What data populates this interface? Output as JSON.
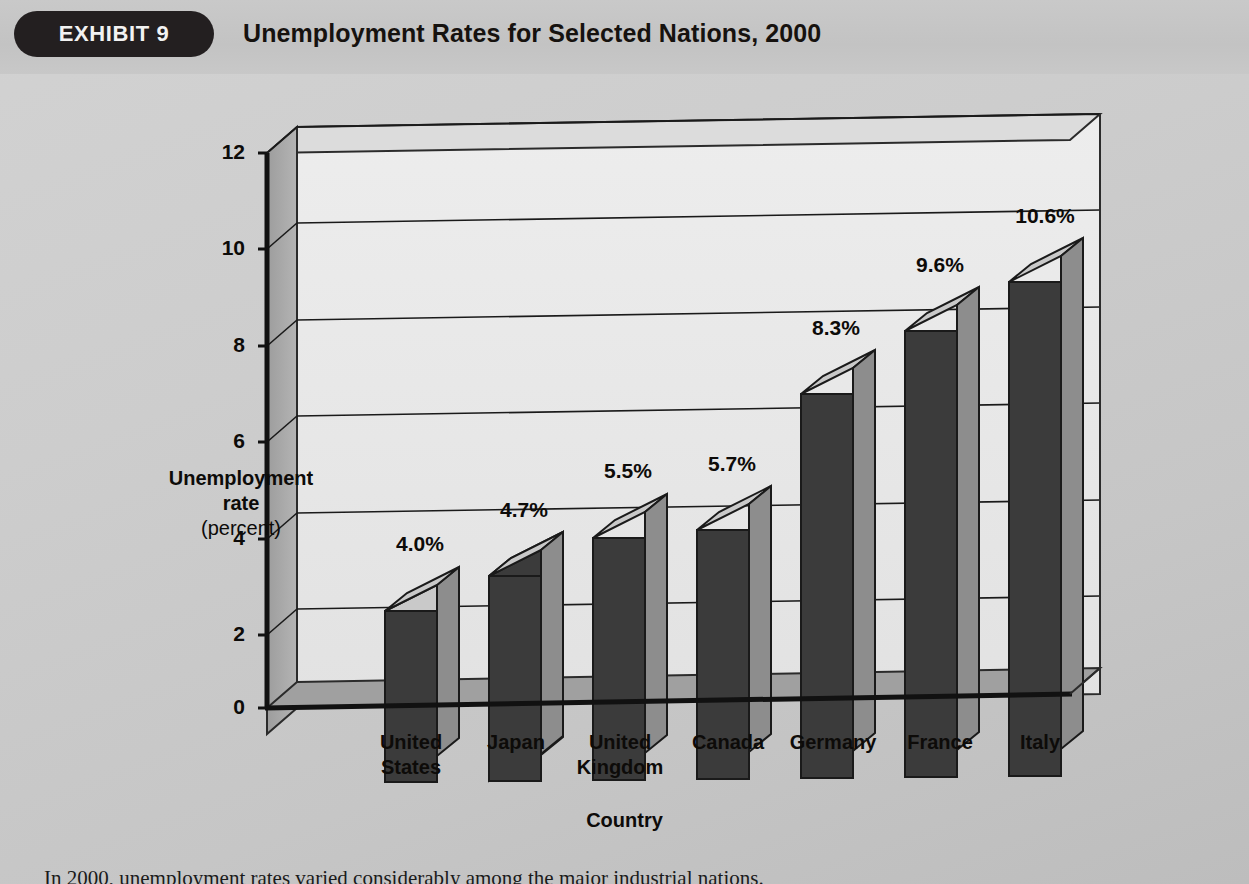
{
  "header": {
    "badge_label": "EXHIBIT 9",
    "title": "Unemployment Rates for Selected Nations, 2000"
  },
  "caption": {
    "text": "In 2000, unemployment rates varied considerably among the major industrial nations."
  },
  "colors": {
    "page_background": "#cbcbcb",
    "badge_background": "#231f20",
    "badge_text": "#f2f2f2",
    "bar_front": "#3d3d3d",
    "bar_top": "#c6c6c6",
    "bar_side": "#8f8f8f",
    "back_panel": "#e9e9e9",
    "left_wall": "#a6a6a6",
    "floor": "#9a9a9a",
    "axis_line": "#111111",
    "text": "#0d0b09"
  },
  "chart_data": {
    "type": "bar",
    "title": "Unemployment Rates for Selected Nations, 2000",
    "categories": [
      "United States",
      "Japan",
      "United Kingdom",
      "Canada",
      "Germany",
      "France",
      "Italy"
    ],
    "category_lines": [
      [
        "United",
        "States"
      ],
      [
        "Japan"
      ],
      [
        "United",
        "Kingdom"
      ],
      [
        "Canada"
      ],
      [
        "Germany"
      ],
      [
        "France"
      ],
      [
        "Italy"
      ]
    ],
    "values": [
      4.0,
      4.7,
      5.5,
      5.7,
      8.3,
      9.6,
      10.6
    ],
    "value_labels": [
      "4.0%",
      "4.7%",
      "5.5%",
      "5.7%",
      "8.3%",
      "9.6%",
      "10.6%"
    ],
    "xlabel": "Country",
    "ylabel": "Unemployment rate",
    "ylabel_sub": "(percent)",
    "ylim": [
      0,
      12
    ],
    "yticks": [
      0,
      2,
      4,
      6,
      8,
      10,
      12
    ],
    "ytick_labels": [
      "0",
      "2",
      "4",
      "6",
      "8",
      "10",
      "12"
    ],
    "grid": true,
    "legend": false,
    "style": "3d-column"
  }
}
